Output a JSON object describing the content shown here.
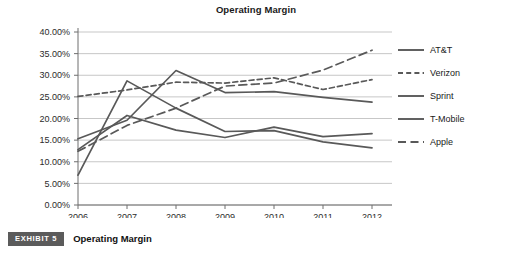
{
  "chart_data": {
    "type": "line",
    "title": "Operating Margin",
    "xlabel": "",
    "ylabel": "",
    "x": [
      "2006",
      "2007",
      "2008",
      "2009",
      "2010",
      "2011",
      "2012"
    ],
    "categories": [
      "2006",
      "2007",
      "2008",
      "2009",
      "2010",
      "2011",
      "2012"
    ],
    "ylim": [
      0,
      40
    ],
    "yticks": [
      0,
      5,
      10,
      15,
      20,
      25,
      30,
      35,
      40
    ],
    "ytick_labels": [
      "0.00%",
      "5.00%",
      "10.00%",
      "15.00%",
      "20.00%",
      "25.00%",
      "30.00%",
      "35.00%",
      "40.00%"
    ],
    "ytick_suffix": "%",
    "grid": true,
    "legend_position": "right",
    "series": [
      {
        "name": "AT&T",
        "style": "solid",
        "color": "#595959",
        "values": [
          12.8,
          20.7,
          17.3,
          15.6,
          18.0,
          15.8,
          16.5
        ]
      },
      {
        "name": "Verizon",
        "style": "dashed-short",
        "color": "#595959",
        "values": [
          25.1,
          26.6,
          28.4,
          28.2,
          29.4,
          26.7,
          29.0
        ]
      },
      {
        "name": "Sprint",
        "style": "solid",
        "color": "#595959",
        "values": [
          15.3,
          19.6,
          31.1,
          26.0,
          26.2,
          24.9,
          23.8
        ]
      },
      {
        "name": "T-Mobile",
        "style": "solid",
        "color": "#595959",
        "values": [
          6.9,
          28.7,
          22.4,
          17.0,
          17.2,
          14.6,
          13.2
        ]
      },
      {
        "name": "Apple",
        "style": "dashed-long",
        "color": "#595959",
        "values": [
          12.4,
          18.4,
          22.4,
          27.5,
          28.2,
          31.2,
          35.8
        ]
      }
    ]
  },
  "caption": {
    "badge": "EXHIBIT 5",
    "text": "Operating Margin"
  }
}
